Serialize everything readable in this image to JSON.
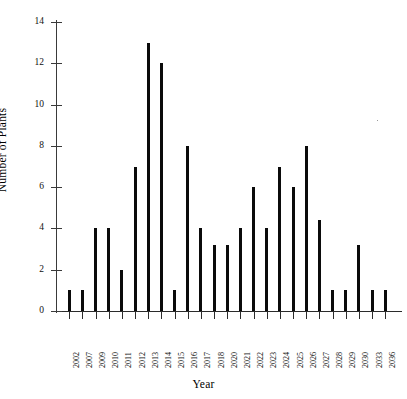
{
  "chart_data": {
    "type": "bar",
    "title": "",
    "xlabel": "Year",
    "ylabel": "Number of Plants",
    "ylim": [
      0,
      14
    ],
    "ytick_labels": [
      "0",
      "2",
      "4",
      "6",
      "8",
      "10",
      "12",
      "14"
    ],
    "ytick_values": [
      0,
      2,
      4,
      6,
      8,
      10,
      12,
      14
    ],
    "grid": false,
    "legend": null,
    "bar_color": "#0b0b0b",
    "axis_color": "#2b2b2b",
    "categories": [
      "2002",
      "2007",
      "2009",
      "2010",
      "2011",
      "2012",
      "2013",
      "2014",
      "2015",
      "2016",
      "2017",
      "2018",
      "2020",
      "2021",
      "2022",
      "2023",
      "2024",
      "2025",
      "2026",
      "2027",
      "2028",
      "2029",
      "2030",
      "2033",
      "2036"
    ],
    "values": [
      1,
      1,
      4,
      4,
      2,
      7,
      13,
      12,
      1,
      8,
      4,
      3.2,
      3.2,
      4,
      6,
      4,
      7,
      6,
      8,
      4.4,
      1,
      1,
      3.2,
      1,
      1
    ],
    "x_tick_labels_visible": [
      "2002",
      "2007",
      "2009",
      "2010",
      "2011",
      "2012",
      "2013",
      "2014",
      "2015",
      "2016",
      "2017",
      "2018",
      "2020",
      "2021",
      "2022",
      "2023",
      "2024",
      "2025",
      "2026",
      "2027",
      "2028",
      "2029",
      "2030",
      "2033",
      "2036"
    ]
  },
  "axes": {
    "y_title": "Number of Plants",
    "x_title": "Year"
  }
}
